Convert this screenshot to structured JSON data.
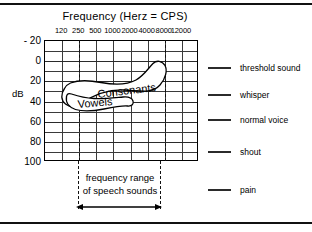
{
  "chart_data": {
    "type": "line",
    "title": "Frequency (Herz = CPS)",
    "xlabel": "Frequency (Herz = CPS)",
    "ylabel": "dB",
    "x_tick_labels": [
      "120",
      "250",
      "500",
      "1000",
      "2000",
      "4000",
      "8000",
      "12000"
    ],
    "y_tick_labels": [
      "- 20",
      "0",
      "20",
      "40",
      "60",
      "80",
      "100"
    ],
    "y_values": [
      -20,
      0,
      20,
      40,
      60,
      80,
      100
    ],
    "ylim": [
      -20,
      100
    ],
    "grid": true,
    "grid_columns": 9,
    "grid_rows": 12,
    "legend_position": "right-outside",
    "regions": [
      {
        "name": "Consonants",
        "label": "Consonants",
        "x_range": [
          "250",
          "8000"
        ],
        "db_range": [
          15,
          45
        ]
      },
      {
        "name": "Vowels",
        "label": "Vowels",
        "x_range": [
          "250",
          "2000"
        ],
        "db_range": [
          28,
          48
        ]
      }
    ],
    "annotations": [
      {
        "name": "speech-range-line1",
        "text": "frequency range"
      },
      {
        "name": "speech-range-line2",
        "text": "of speech sounds"
      }
    ],
    "markers": [
      {
        "label": "threshold sound",
        "db": 0
      },
      {
        "label": "whisper",
        "db": 20
      },
      {
        "label": "normal voice",
        "db": 50
      },
      {
        "label": "shout",
        "db": 80
      },
      {
        "label": "pain",
        "db": 120
      }
    ]
  },
  "chart": {
    "title": "Frequency (Herz = CPS)",
    "y_axis_label": "dB",
    "x_ticks": [
      {
        "label": "120"
      },
      {
        "label": "250"
      },
      {
        "label": "500"
      },
      {
        "label": "1000"
      },
      {
        "label": "2000"
      },
      {
        "label": "4000"
      },
      {
        "label": "8000"
      },
      {
        "label": "12000"
      }
    ],
    "y_ticks": [
      {
        "label": "- 20"
      },
      {
        "label": "0"
      },
      {
        "label": "20"
      },
      {
        "label": "40"
      },
      {
        "label": "60"
      },
      {
        "label": "80"
      },
      {
        "label": "100"
      }
    ],
    "banana": {
      "consonants_label": "Consonants",
      "vowels_label": "Vowels"
    },
    "legend": [
      {
        "label": "threshold sound"
      },
      {
        "label": "whisper"
      },
      {
        "label": "normal voice"
      },
      {
        "label": "shout"
      },
      {
        "label": "pain"
      }
    ],
    "range_note": {
      "line1": "frequency range",
      "line2": "of speech sounds"
    }
  },
  "colors": {
    "ink": "#000000",
    "grid": "#3a3a3a",
    "background": "#ffffff"
  }
}
